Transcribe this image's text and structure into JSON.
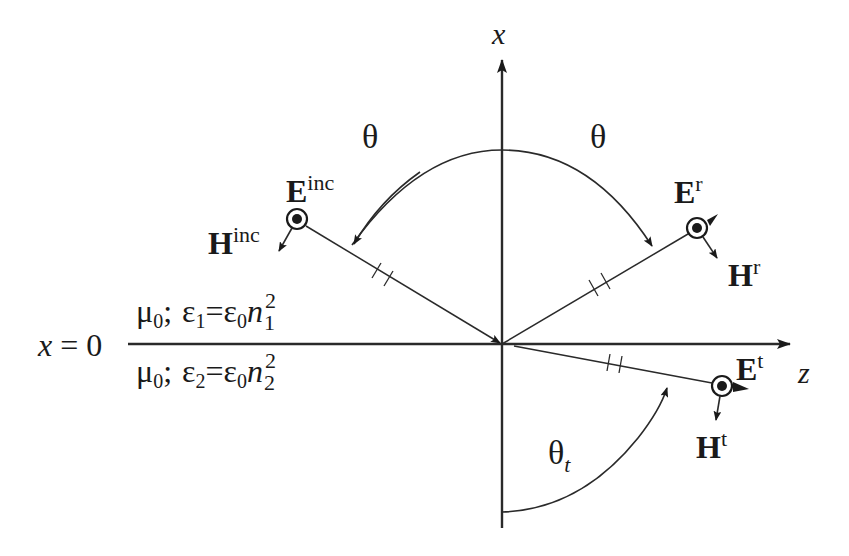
{
  "figure": {
    "type": "plane-wave reflection/refraction at dielectric interface",
    "colors": {
      "ink": "#1a1a1a",
      "background": "#ffffff"
    }
  },
  "axes": {
    "vertical_label": "x",
    "horizontal_label": "z",
    "interface_label": "x = 0"
  },
  "media": {
    "upper": {
      "mu": "μ",
      "mu_sub": "0",
      "sep": ";",
      "eps": "ε",
      "eps_sub": "1",
      "eq": "=",
      "eps0": "ε",
      "eps0_sub": "0",
      "n": "n",
      "n_sup": "2",
      "n_sub": "1"
    },
    "lower": {
      "mu": "μ",
      "mu_sub": "0",
      "sep": ";",
      "eps": "ε",
      "eps_sub": "2",
      "eq": "=",
      "eps0": "ε",
      "eps0_sub": "0",
      "n": "n",
      "n_sup": "2",
      "n_sub": "2"
    }
  },
  "angles": {
    "incident": "θ",
    "reflected": "θ",
    "transmitted": "θ",
    "transmitted_sub": "t"
  },
  "fields": {
    "incident": {
      "E": "E",
      "E_sup": "inc",
      "H": "H",
      "H_sup": "inc"
    },
    "reflected": {
      "E": "E",
      "E_sup": "r",
      "H": "H",
      "H_sup": "r"
    },
    "transmitted": {
      "E": "E",
      "E_sup": "t",
      "H": "H",
      "H_sup": "t"
    }
  }
}
